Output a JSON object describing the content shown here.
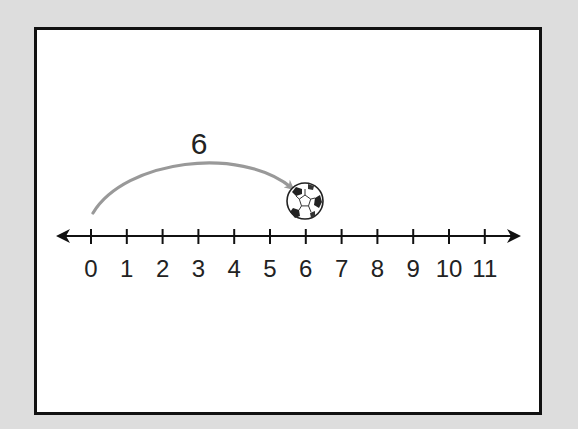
{
  "diagram": {
    "type": "number-line-jump",
    "jump": {
      "label": "6",
      "from": 0,
      "to": 6
    },
    "number_line": {
      "min": 0,
      "max": 11,
      "ticks": [
        "0",
        "1",
        "2",
        "3",
        "4",
        "5",
        "6",
        "7",
        "8",
        "9",
        "10",
        "11"
      ],
      "arrows": "both"
    },
    "marker": {
      "icon": "soccer-ball-icon",
      "at": 6
    },
    "colors": {
      "background": "#dddddd",
      "panel": "#ffffff",
      "border": "#111111",
      "axis": "#111111",
      "arc": "#999999",
      "text": "#222222"
    }
  }
}
